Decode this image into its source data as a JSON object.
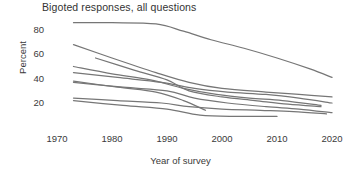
{
  "chart_data": {
    "type": "line",
    "title": "Bigoted responses, all questions",
    "xlabel": "Year of survey",
    "ylabel": "Percent",
    "xlim": [
      1968,
      2022
    ],
    "ylim": [
      5,
      90
    ],
    "xticks": [
      "1970",
      "1980",
      "1990",
      "2000",
      "2010",
      "2020"
    ],
    "yticks": [
      "20",
      "40",
      "60",
      "80"
    ],
    "grid": false,
    "legend": "none",
    "series": [
      {
        "name": "question-1",
        "x": [
          1973,
          1980,
          1988,
          1993,
          1998,
          2004,
          2010,
          2016,
          2020
        ],
        "values": [
          86,
          86,
          85,
          79,
          72,
          65,
          57,
          48,
          41
        ]
      },
      {
        "name": "question-2",
        "x": [
          1973,
          1980,
          1988,
          1994,
          2000,
          2008,
          2014,
          2020
        ],
        "values": [
          68,
          57,
          45,
          37,
          32,
          29,
          27,
          25
        ]
      },
      {
        "name": "question-3",
        "x": [
          1977,
          1984,
          1990,
          1994,
          2000,
          2006,
          2012,
          2018
        ],
        "values": [
          57,
          47,
          39,
          30,
          25,
          22,
          19,
          17
        ]
      },
      {
        "name": "question-4",
        "x": [
          1973,
          1980,
          1987,
          1993,
          1999,
          2005,
          2011,
          2018
        ],
        "values": [
          50,
          44,
          39,
          32,
          27,
          24,
          22,
          18
        ]
      },
      {
        "name": "question-5",
        "x": [
          1973,
          1981,
          1989,
          1995,
          2001,
          2008,
          2014,
          2020
        ],
        "values": [
          45,
          41,
          37,
          32,
          29,
          27,
          24,
          20
        ]
      },
      {
        "name": "question-6",
        "x": [
          1973,
          1982,
          1990,
          1995,
          2001,
          2008,
          2014,
          2020
        ],
        "values": [
          37,
          33,
          30,
          24,
          20,
          17,
          15,
          12
        ]
      },
      {
        "name": "question-7",
        "x": [
          1973,
          1981,
          1989,
          1994,
          2000,
          2007,
          2013,
          2019
        ],
        "values": [
          24,
          22,
          20,
          17,
          15,
          14,
          13,
          11
        ]
      },
      {
        "name": "question-8",
        "x": [
          1973,
          1982,
          1990,
          1996,
          2003,
          2010
        ],
        "values": [
          22,
          18,
          15,
          10,
          9,
          9
        ]
      },
      {
        "name": "question-9",
        "x": [
          1973,
          1981,
          1988,
          1993,
          1997
        ],
        "values": [
          38,
          33,
          29,
          22,
          14
        ]
      }
    ]
  },
  "axes": {
    "y_ticks": [
      {
        "label": "80",
        "value": 80
      },
      {
        "label": "60",
        "value": 60
      },
      {
        "label": "40",
        "value": 40
      },
      {
        "label": "20",
        "value": 20
      }
    ],
    "x_ticks": [
      {
        "label": "1970",
        "value": 1970
      },
      {
        "label": "1980",
        "value": 1980
      },
      {
        "label": "1990",
        "value": 1990
      },
      {
        "label": "2000",
        "value": 2000
      },
      {
        "label": "2010",
        "value": 2010
      },
      {
        "label": "2020",
        "value": 2020
      }
    ]
  },
  "style": {
    "line_color": "#767676",
    "text_color": "#3a3a3a",
    "background": "#ffffff"
  }
}
